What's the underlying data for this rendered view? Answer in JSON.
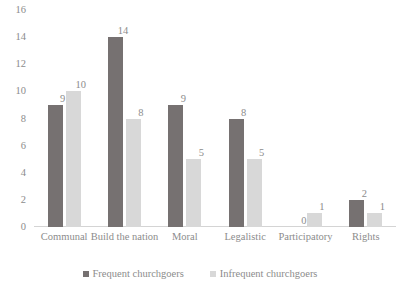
{
  "chart_data": {
    "type": "bar",
    "title": "",
    "subtitle": "",
    "xlabel": "",
    "ylabel": "",
    "ylim": [
      0,
      16
    ],
    "ytick_step": 2,
    "yticks": [
      16,
      14,
      12,
      10,
      8,
      6,
      4,
      2,
      0
    ],
    "grid": false,
    "legend_position": "bottom",
    "categories": [
      "Communal",
      "Build the nation",
      "Moral",
      "Legalistic",
      "Participatory",
      "Rights"
    ],
    "series": [
      {
        "name": "Frequent churchgoers",
        "color": "#767171",
        "values": [
          9,
          14,
          9,
          8,
          0,
          2
        ]
      },
      {
        "name": "Infrequent churchgoers",
        "color": "#d8d8d8",
        "values": [
          10,
          8,
          5,
          5,
          1,
          1
        ]
      }
    ],
    "data_labels": true,
    "axis_color": "#d4d4d4",
    "text_color": "#8c8c8c"
  }
}
